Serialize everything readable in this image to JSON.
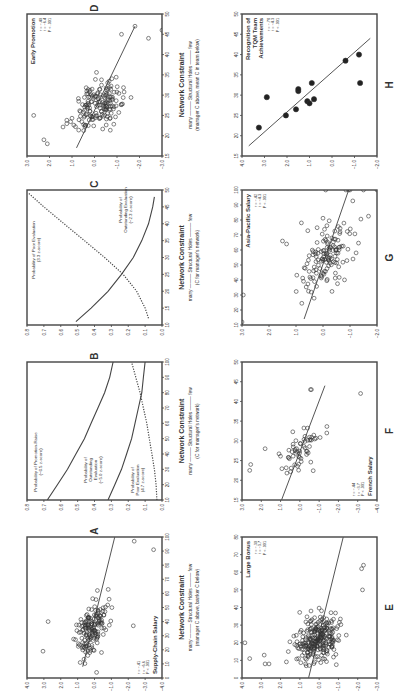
{
  "figure": {
    "x_axis_title": "Network Constraint",
    "x_axis_arrow_left": "many",
    "x_axis_arrow_mid": "Structural Holes",
    "x_axis_arrow_right": "few"
  },
  "chart_data": [
    {
      "id": "A",
      "type": "scatter",
      "title": "Supply-Chain Salary",
      "stats": [
        "r = -.41",
        "t = -6.6",
        "P < .001"
      ],
      "xlabel": "Network Constraint",
      "xsub": "(manager C above, banker C below)",
      "xlim": [
        0,
        100
      ],
      "xticks": [
        0,
        10,
        20,
        30,
        40,
        50,
        60,
        70,
        80,
        90,
        100
      ],
      "ylim": [
        -4.0,
        4.0
      ],
      "yticks": [
        "4.0",
        "3.0",
        "2.0",
        "1.0",
        "0.0",
        "-1.0",
        "-2.0",
        "-3.0",
        "-4.0"
      ],
      "regression_line": [
        [
          8,
          0.7
        ],
        [
          100,
          -1.2
        ]
      ],
      "n_points": 160,
      "x_center": 35,
      "x_spread": 18,
      "noise": 0.6,
      "seed": 11,
      "extra_points": [
        [
          19,
          3.05
        ],
        [
          40,
          2.75
        ],
        [
          91,
          -3.5
        ],
        [
          97,
          -2.35
        ],
        [
          37,
          -2.3
        ]
      ],
      "stats_pos": "bottom-left"
    },
    {
      "id": "B",
      "type": "line",
      "title": "",
      "xlabel": "Network Constraint",
      "xsub": "(C for manager's network)",
      "xlim": [
        10,
        100
      ],
      "xticks": [
        10,
        20,
        30,
        40,
        50,
        60,
        70,
        80,
        90,
        100
      ],
      "ylim": [
        0.0,
        0.8
      ],
      "yticks": [
        "0.8",
        "0.7",
        "0.6",
        "0.5",
        "0.4",
        "0.3",
        "0.2",
        "0.1",
        "0.0"
      ],
      "series": [
        {
          "name": "Probability of Promotion-Raise (-6.5 z-score)",
          "style": "solid",
          "x": [
            10,
            20,
            30,
            40,
            50,
            60,
            70,
            80,
            90,
            100
          ],
          "y": [
            0.68,
            0.62,
            0.56,
            0.51,
            0.46,
            0.42,
            0.38,
            0.34,
            0.31,
            0.29
          ]
        },
        {
          "name": "Probability of Outstanding Evaluation (-5.0 z-score)",
          "style": "solid",
          "x": [
            10,
            20,
            30,
            40,
            50,
            60,
            70,
            80,
            90,
            100
          ],
          "y": [
            0.32,
            0.28,
            0.24,
            0.21,
            0.18,
            0.16,
            0.14,
            0.12,
            0.11,
            0.1
          ]
        },
        {
          "name": "Probability of Poor Evaluation (4.7 z-score)",
          "style": "dotted",
          "x": [
            10,
            20,
            30,
            40,
            50,
            60,
            70,
            80,
            90,
            100
          ],
          "y": [
            0.03,
            0.035,
            0.045,
            0.06,
            0.075,
            0.09,
            0.11,
            0.13,
            0.155,
            0.18
          ]
        }
      ]
    },
    {
      "id": "C",
      "type": "line",
      "title": "",
      "xlabel": "Network Constraint",
      "xsub": "(C for manager's network)",
      "xlim": [
        10,
        50
      ],
      "xticks": [
        10,
        15,
        20,
        25,
        30,
        35,
        40,
        45,
        50
      ],
      "ylim": [
        0.0,
        0.8
      ],
      "yticks": [
        "0.8",
        "0.7",
        "0.6",
        "0.5",
        "0.4",
        "0.3",
        "0.2",
        "0.1",
        "0.0"
      ],
      "series": [
        {
          "name": "Probability of Poor Evaluation (3.3 z-score)",
          "style": "dotted",
          "x": [
            12,
            15,
            20,
            25,
            30,
            35,
            40,
            45,
            49
          ],
          "y": [
            0.08,
            0.1,
            0.15,
            0.23,
            0.34,
            0.46,
            0.58,
            0.7,
            0.79
          ]
        },
        {
          "name": "Probability of Outstanding Evaluation (-2.3 z-score)",
          "style": "solid",
          "x": [
            11,
            15,
            20,
            25,
            30,
            35,
            40,
            45,
            48
          ],
          "y": [
            0.51,
            0.42,
            0.32,
            0.24,
            0.17,
            0.12,
            0.08,
            0.055,
            0.045
          ]
        }
      ]
    },
    {
      "id": "D",
      "type": "scatter",
      "title": "Early Promotion",
      "stats": [
        "r = -.40",
        "t = -6.4",
        "P < .001"
      ],
      "xlabel": "Network Constraint",
      "xsub": "(manager C above, mean C in team below)",
      "xlim": [
        15,
        50
      ],
      "xticks": [
        15,
        20,
        25,
        30,
        35,
        40,
        45,
        50
      ],
      "ylim": [
        -3.0,
        3.0
      ],
      "yticks": [
        "3.0",
        "2.0",
        "1.0",
        "0.0",
        "-1.0",
        "-2.0",
        "-3.0"
      ],
      "regression_line": [
        [
          17,
          0.8
        ],
        [
          47,
          -1.8
        ]
      ],
      "n_points": 170,
      "x_center": 28,
      "x_spread": 5,
      "noise": 0.75,
      "seed": 7,
      "extra_points": [
        [
          25,
          2.7
        ],
        [
          18,
          2.1
        ],
        [
          19,
          2.25
        ],
        [
          44,
          -2.4
        ],
        [
          46,
          -3.0
        ],
        [
          47,
          -1.8
        ],
        [
          45,
          -1.2
        ]
      ],
      "stats_pos": "top-left"
    },
    {
      "id": "E",
      "type": "scatter",
      "title": "Large Bonus",
      "stats": [
        "r = -.30",
        "t = -3.7",
        "P < .001"
      ],
      "xlabel": "Network Constraint",
      "xlim": [
        0,
        80
      ],
      "xticks": [
        0,
        10,
        20,
        30,
        40,
        50,
        60,
        70,
        80
      ],
      "ylim": [
        -3.0,
        4.0
      ],
      "yticks": [
        "4.0",
        "3.0",
        "2.0",
        "1.0",
        "0.0",
        "-1.0",
        "-2.0",
        "-3.0"
      ],
      "regression_line": [
        [
          0,
          0.55
        ],
        [
          80,
          -1.25
        ]
      ],
      "n_points": 260,
      "x_center": 22,
      "x_spread": 12,
      "noise": 0.8,
      "seed": 23,
      "extra_points": [
        [
          20,
          3.85
        ],
        [
          11,
          3.6
        ],
        [
          8,
          2.8
        ],
        [
          8,
          2.6
        ],
        [
          13,
          2.85
        ],
        [
          50,
          -2.25
        ],
        [
          62,
          -2.2
        ],
        [
          64,
          -2.3
        ]
      ],
      "stats_pos": "top-left"
    },
    {
      "id": "F",
      "type": "scatter",
      "title": "French Salary",
      "stats": [
        "r = -.44",
        "t = -3.7",
        "P < .001"
      ],
      "xlabel": "Network Constraint",
      "xlim": [
        15,
        50
      ],
      "xticks": [
        15,
        20,
        25,
        30,
        35,
        40,
        45,
        50
      ],
      "ylim": [
        -4.0,
        3.0
      ],
      "yticks": [
        "3.0",
        "2.0",
        "1.0",
        "0.0",
        "-1.0",
        "-2.0",
        "-3.0",
        "-4.0"
      ],
      "regression_line": [
        [
          15,
          0.95
        ],
        [
          44,
          -1.3
        ]
      ],
      "n_points": 60,
      "x_center": 27,
      "x_spread": 5,
      "noise": 0.6,
      "seed": 5,
      "extra_points": [
        [
          22.5,
          2.6
        ],
        [
          24,
          2.55
        ],
        [
          28,
          1.8
        ],
        [
          42,
          -3.15
        ],
        [
          43,
          -0.6
        ],
        [
          43,
          -0.55
        ]
      ],
      "stats_pos": "bottom-left"
    },
    {
      "id": "G",
      "type": "scatter",
      "title": "Asia-Pacific Salary",
      "stats": [
        "r = -.42",
        "t = -4.3",
        "P < .001"
      ],
      "xlabel": "Network Constraint",
      "xlim": [
        10,
        100
      ],
      "xticks": [
        10,
        20,
        30,
        40,
        50,
        60,
        70,
        80,
        90,
        100
      ],
      "ylim": [
        -2.0,
        3.0
      ],
      "yticks": [
        "3.0",
        "2.0",
        "1.0",
        "0.0",
        "-1.0",
        "-2.0"
      ],
      "regression_line": [
        [
          14,
          0.7
        ],
        [
          100,
          -0.95
        ]
      ],
      "n_points": 140,
      "x_center": 55,
      "x_spread": 22,
      "noise": 0.7,
      "seed": 31,
      "extra_points": [
        [
          12,
          3.0
        ],
        [
          30,
          2.95
        ],
        [
          100,
          -0.1
        ],
        [
          100,
          -0.85
        ],
        [
          100,
          -0.95
        ],
        [
          100,
          -1.0
        ],
        [
          100,
          -1.5
        ],
        [
          100,
          -2.0
        ],
        [
          66,
          1.5
        ],
        [
          64,
          1.35
        ]
      ],
      "stats_pos": "top-left"
    },
    {
      "id": "H",
      "type": "scatter",
      "title": "Recognition of TQM Team Achievements",
      "title_lines": [
        "Recognition of",
        "TQM Team",
        "Achievements"
      ],
      "stats": [
        "r = -.78",
        "t = -4.3",
        "P < .001"
      ],
      "xlabel": "Network Constraint",
      "xlim": [
        15,
        50
      ],
      "xticks": [
        15,
        20,
        25,
        30,
        35,
        40,
        45,
        50
      ],
      "ylim": [
        -2.0,
        4.0
      ],
      "yticks": [
        "4.0",
        "3.0",
        "2.0",
        "1.0",
        "0.0",
        "-1.0",
        "-2.0"
      ],
      "regression_line": [
        [
          17.5,
          3.7
        ],
        [
          44,
          -1.7
        ]
      ],
      "points": [
        [
          22,
          3.25
        ],
        [
          29.5,
          2.9
        ],
        [
          25,
          2.05
        ],
        [
          26.5,
          1.6
        ],
        [
          31,
          1.5
        ],
        [
          31.5,
          1.5
        ],
        [
          28.5,
          1.1
        ],
        [
          28,
          1.0
        ],
        [
          29,
          0.8
        ],
        [
          33,
          0.9
        ],
        [
          38.5,
          -0.6
        ],
        [
          40,
          -1.2
        ],
        [
          33,
          -1.25
        ]
      ],
      "stats_pos": "top-left"
    }
  ],
  "panels_layout": {
    "left_column": [
      "D",
      "C",
      "B",
      "A"
    ],
    "right_column": [
      "H",
      "G",
      "F",
      "E"
    ]
  }
}
